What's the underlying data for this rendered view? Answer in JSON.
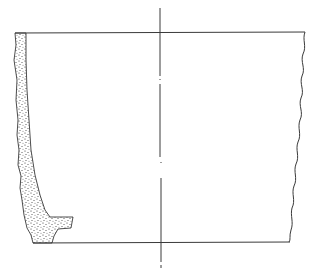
{
  "figure": {
    "type": "archaeological pottery profile drawing",
    "colors": {
      "background": "#ffffff",
      "line": "#3a3a3a",
      "stipple": "#2a2a2a"
    },
    "elements": {
      "rim_line": {
        "x1": 15,
        "y1": 33,
        "x2": 305,
        "y2": 32
      },
      "base_line": {
        "x1": 33,
        "y1": 243,
        "x2": 290,
        "y2": 242
      },
      "center_axis": {
        "x": 160,
        "y_top": 8,
        "y_bottom": 268,
        "style": "dash-dot"
      },
      "profile_section": {
        "fill": "stippled",
        "side": "left"
      },
      "outer_wall": {
        "side": "right",
        "style": "wavy broken edge"
      }
    },
    "text_labels": []
  }
}
